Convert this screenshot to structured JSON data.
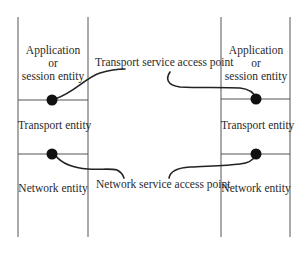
{
  "diagram": {
    "type": "protocol-stack-service-access-points",
    "stacks": [
      {
        "side": "left",
        "layers": [
          {
            "lines": [
              "Application",
              "or",
              "session entity"
            ]
          },
          {
            "lines": [
              "Transport entity"
            ]
          },
          {
            "lines": [
              "Network entity"
            ]
          }
        ]
      },
      {
        "side": "right",
        "layers": [
          {
            "lines": [
              "Application",
              "or",
              "session entity"
            ]
          },
          {
            "lines": [
              "Transport entity"
            ]
          },
          {
            "lines": [
              "Network entity"
            ]
          }
        ]
      }
    ],
    "callouts": {
      "transport_sap": "Transport service access point",
      "network_sap": "Network service access point"
    },
    "colors": {
      "line": "#555555",
      "dot": "#111111",
      "curve": "#222222",
      "background": "#ffffff"
    }
  }
}
